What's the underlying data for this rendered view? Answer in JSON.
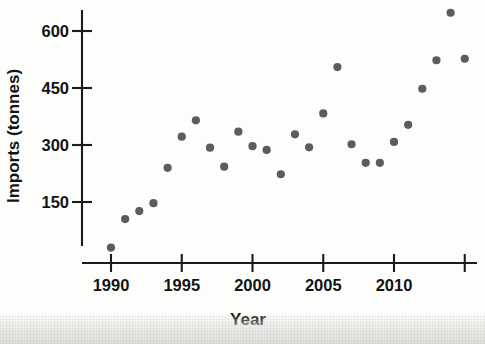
{
  "chart_data": {
    "type": "scatter",
    "title": "",
    "xlabel": "Year",
    "ylabel": "Imports (tonnes)",
    "xlim": [
      1989.5,
      2015.4
    ],
    "ylim": [
      0,
      660
    ],
    "grid": false,
    "legend": false,
    "point_color": "#5c5c5c",
    "axis_color": "#1b1b1b",
    "xticks": [
      1990,
      1995,
      2000,
      2005,
      2010
    ],
    "xtick_labels": [
      "1990",
      "1995",
      "2000",
      "2005",
      "2010"
    ],
    "yticks": [
      150,
      300,
      450,
      600
    ],
    "ytick_labels": [
      "150",
      "300",
      "450",
      "600"
    ],
    "x": [
      1990,
      1991,
      1992,
      1993,
      1994,
      1995,
      1996,
      1997,
      1998,
      1999,
      2000,
      2001,
      2002,
      2003,
      2004,
      2005,
      2006,
      2007,
      2008,
      2009,
      2010,
      2011,
      2012,
      2013,
      2014,
      2015
    ],
    "values": [
      30,
      105,
      126,
      147,
      240,
      322,
      365,
      293,
      243,
      335,
      297,
      287,
      223,
      328,
      294,
      383,
      505,
      302,
      253,
      253,
      308,
      353,
      448,
      523,
      648,
      527
    ],
    "points": [
      {
        "year": 1990,
        "imports": 30
      },
      {
        "year": 1991,
        "imports": 105
      },
      {
        "year": 1992,
        "imports": 126
      },
      {
        "year": 1993,
        "imports": 147
      },
      {
        "year": 1994,
        "imports": 240
      },
      {
        "year": 1995,
        "imports": 322
      },
      {
        "year": 1996,
        "imports": 365
      },
      {
        "year": 1997,
        "imports": 293
      },
      {
        "year": 1998,
        "imports": 243
      },
      {
        "year": 1999,
        "imports": 335
      },
      {
        "year": 2000,
        "imports": 297
      },
      {
        "year": 2001,
        "imports": 287
      },
      {
        "year": 2002,
        "imports": 223
      },
      {
        "year": 2003,
        "imports": 328
      },
      {
        "year": 2004,
        "imports": 294
      },
      {
        "year": 2005,
        "imports": 383
      },
      {
        "year": 2006,
        "imports": 505
      },
      {
        "year": 2007,
        "imports": 302
      },
      {
        "year": 2008,
        "imports": 253
      },
      {
        "year": 2009,
        "imports": 253
      },
      {
        "year": 2010,
        "imports": 308
      },
      {
        "year": 2011,
        "imports": 353
      },
      {
        "year": 2012,
        "imports": 448
      },
      {
        "year": 2013,
        "imports": 523
      },
      {
        "year": 2014,
        "imports": 648
      },
      {
        "year": 2015,
        "imports": 527
      }
    ]
  }
}
